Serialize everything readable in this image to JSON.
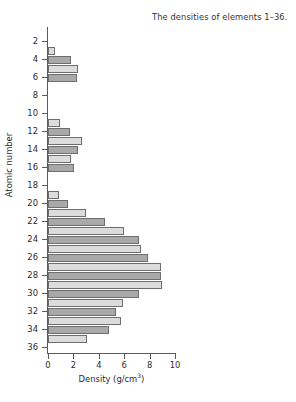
{
  "chart_data": {
    "type": "bar",
    "orientation": "horizontal",
    "title": "The densities of elements 1–36.",
    "xlabel": "Density (g/cm",
    "xlabel_sup": "3",
    "xlabel_tail": ")",
    "ylabel": "Atomic number",
    "xlim": [
      0,
      10
    ],
    "ylim": [
      1,
      36
    ],
    "grid": false,
    "legend": null,
    "x_ticks": [
      0,
      2,
      4,
      6,
      8,
      10
    ],
    "x_tick_labels": [
      "0",
      "2",
      "4",
      "6",
      "8",
      "10"
    ],
    "y_ticks": [
      2,
      4,
      6,
      8,
      10,
      12,
      14,
      16,
      18,
      20,
      22,
      24,
      26,
      28,
      30,
      32,
      34,
      36
    ],
    "y_tick_labels": [
      "2",
      "4",
      "6",
      "8",
      "10",
      "12",
      "14",
      "16",
      "18",
      "20",
      "22",
      "24",
      "26",
      "28",
      "30",
      "32",
      "34",
      "36"
    ],
    "categories": [
      1,
      2,
      3,
      4,
      5,
      6,
      7,
      8,
      9,
      10,
      11,
      12,
      13,
      14,
      15,
      16,
      17,
      18,
      19,
      20,
      21,
      22,
      23,
      24,
      25,
      26,
      27,
      28,
      29,
      30,
      31,
      32,
      33,
      34,
      35,
      36
    ],
    "values": [
      9e-05,
      0.00018,
      0.53,
      1.85,
      2.34,
      2.26,
      0.0013,
      0.0014,
      0.0017,
      0.0009,
      0.97,
      1.74,
      2.7,
      2.33,
      1.82,
      2.07,
      0.0032,
      0.0018,
      0.86,
      1.55,
      2.99,
      4.51,
      6.0,
      7.15,
      7.3,
      7.87,
      8.86,
      8.9,
      8.96,
      7.13,
      5.91,
      5.32,
      5.78,
      4.81,
      3.1,
      0.0037
    ],
    "bar_shades": [
      "light",
      "dark",
      "light",
      "dark",
      "light",
      "dark",
      "light",
      "dark",
      "light",
      "dark",
      "light",
      "dark",
      "light",
      "dark",
      "light",
      "dark",
      "light",
      "dark",
      "light",
      "dark",
      "light",
      "dark",
      "light",
      "dark",
      "light",
      "dark",
      "light",
      "dark",
      "light",
      "dark",
      "light",
      "dark",
      "light",
      "dark",
      "light",
      "dark"
    ],
    "colors": {
      "bar_light": "#dcdcdc",
      "bar_dark": "#a9a9a9",
      "bar_edge": "#6e6e6e",
      "axis": "#5a5a5a",
      "text": "#2b2b2b"
    },
    "max_value": 8.96,
    "max_value_element": 29
  }
}
